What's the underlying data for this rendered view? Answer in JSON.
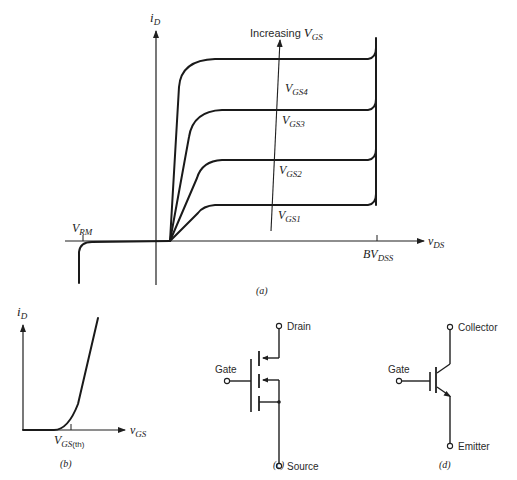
{
  "panel_a": {
    "caption": "(a)",
    "y_axis_label_main": "i",
    "y_axis_label_sub": "D",
    "x_axis_label_main": "v",
    "x_axis_label_sub": "DS",
    "increasing_label_text": "Increasing ",
    "increasing_label_var": "V",
    "increasing_label_sub": "GS",
    "vrm_main": "V",
    "vrm_sub": "RM",
    "bvdss_main": "BV",
    "bvdss_sub": "DSS",
    "curves": [
      {
        "main": "V",
        "sub": "GS4"
      },
      {
        "main": "V",
        "sub": "GS3"
      },
      {
        "main": "V",
        "sub": "GS2"
      },
      {
        "main": "V",
        "sub": "GS1"
      }
    ]
  },
  "panel_b": {
    "caption": "(b)",
    "y_axis_label_main": "i",
    "y_axis_label_sub": "D",
    "x_axis_label_main": "v",
    "x_axis_label_sub": "GS",
    "threshold_main": "V",
    "threshold_sub": "GS",
    "threshold_suffix": "(th)"
  },
  "panel_c": {
    "caption": "(c)",
    "drain_label": "Drain",
    "gate_label": "Gate",
    "source_label": "Source"
  },
  "panel_d": {
    "caption": "(d)",
    "collector_label": "Collector",
    "gate_label": "Gate",
    "emitter_label": "Emitter"
  }
}
